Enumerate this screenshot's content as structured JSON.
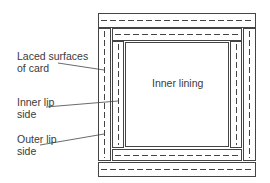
{
  "diagram": {
    "labels": {
      "laced_surfaces": "Laced surfaces\nof card",
      "inner_lip": "Inner lip\nside",
      "outer_lip": "Outer lip\nside",
      "inner_lining": "Inner lining"
    },
    "colors": {
      "line": "#444444",
      "text": "#3a3a3a",
      "background": "#ffffff"
    },
    "pieces": [
      {
        "name": "outer-top-strip",
        "x": 98,
        "y": 13,
        "w": 157,
        "h": 14,
        "dash": "horizontal"
      },
      {
        "name": "outer-bottom-strip",
        "x": 98,
        "y": 162,
        "w": 157,
        "h": 14,
        "dash": "horizontal"
      },
      {
        "name": "outer-left-strip",
        "x": 98,
        "y": 28,
        "w": 12,
        "h": 132,
        "dash": "vertical"
      },
      {
        "name": "outer-right-strip",
        "x": 243,
        "y": 28,
        "w": 12,
        "h": 132,
        "dash": "vertical"
      },
      {
        "name": "inner-top-strip",
        "x": 112,
        "y": 28,
        "w": 130,
        "h": 12,
        "dash": "horizontal"
      },
      {
        "name": "inner-bottom-strip",
        "x": 112,
        "y": 149,
        "w": 130,
        "h": 11,
        "dash": "horizontal"
      },
      {
        "name": "inner-left-strip",
        "x": 112,
        "y": 41,
        "w": 12,
        "h": 107,
        "dash": "vertical"
      },
      {
        "name": "inner-right-strip",
        "x": 230,
        "y": 41,
        "w": 12,
        "h": 107,
        "dash": "vertical"
      },
      {
        "name": "inner-lining-panel",
        "x": 125,
        "y": 42,
        "w": 104,
        "h": 105,
        "dash": "none"
      }
    ]
  }
}
